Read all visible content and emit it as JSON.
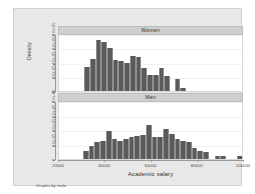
{
  "chart_data": {
    "type": "bar",
    "title": "",
    "xlabel": "Academic salary",
    "ylabel": "Density",
    "note": "Graphs by male",
    "xlim": [
      20000,
      100000
    ],
    "ylim": [
      0,
      8e-05
    ],
    "grid": true,
    "legend_position": "none",
    "bar_color": "#5a5a5a",
    "panel_header_color": "#cfcfcf",
    "graph_background": "#e8e8e8",
    "plot_background": "#ffffff",
    "xticks": [
      "20000",
      "40000",
      "60000",
      "80000",
      "100000"
    ],
    "xtick_values": [
      20000,
      40000,
      60000,
      80000,
      100000
    ],
    "yticks": [
      "0",
      "2.0e-05",
      "4.0e-05",
      "6.0e-05",
      "8.0e-05"
    ],
    "ytick_values": [
      0,
      2e-05,
      4e-05,
      6e-05,
      8e-05
    ],
    "panels": [
      {
        "label": "Women",
        "bin_width": 2500,
        "bin_starts": [
          31000,
          33500,
          36000,
          38500,
          41000,
          43500,
          46000,
          48500,
          51000,
          53500,
          56000,
          58500,
          61000,
          63500,
          66000,
          70500,
          73000
        ],
        "values": [
          3.4e-05,
          4.55e-05,
          7.22e-05,
          6.9e-05,
          6.1e-05,
          4.3e-05,
          4.2e-05,
          4e-05,
          4.9e-05,
          4.8e-05,
          3.3e-05,
          2.2e-05,
          2.25e-05,
          3.2e-05,
          2.15e-05,
          1.75e-05,
          4e-06,
          4e-06
        ]
      },
      {
        "label": "Men",
        "bin_width": 2500,
        "bin_starts": [
          30500,
          33000,
          35500,
          38000,
          40500,
          43000,
          45500,
          48000,
          50500,
          53000,
          55500,
          58000,
          60500,
          63000,
          65500,
          68000,
          70500,
          73000,
          75500,
          78000,
          80500,
          83000,
          88000,
          90500,
          98000
        ],
        "values": [
          1.1e-05,
          1.85e-05,
          2.3e-05,
          2.5e-05,
          3.8e-05,
          2.7e-05,
          2.5e-05,
          2.8e-05,
          3e-05,
          3.2e-05,
          3.3e-05,
          4.7e-05,
          3e-05,
          3e-05,
          4.1e-05,
          3.5e-05,
          2.8e-05,
          2.5e-05,
          2.3e-05,
          1.5e-05,
          1.1e-05,
          9e-06,
          4.5e-06,
          4.5e-06,
          3.5e-06
        ]
      }
    ]
  }
}
